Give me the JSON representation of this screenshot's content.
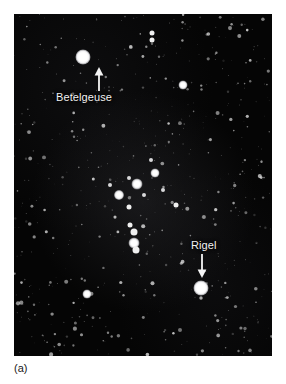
{
  "figure": {
    "caption": "(a)",
    "background_color": "#ffffff",
    "plate_color": "#050505"
  },
  "photo": {
    "subject": "Orion constellation night sky photograph",
    "frame": {
      "left": 14,
      "top": 14,
      "width": 258,
      "height": 342
    }
  },
  "annotations": [
    {
      "id": "betelgeuse",
      "label": "Betelgeuse",
      "label_x": 56,
      "label_y": 91,
      "arrow_direction": "up",
      "arrow_x": 84,
      "arrow_y_tail": 89,
      "arrow_y_head": 68,
      "target_star_x": 83,
      "target_star_y": 57
    },
    {
      "id": "rigel",
      "label": "Rigel",
      "label_x": 191,
      "label_y": 239,
      "arrow_direction": "down",
      "arrow_x": 201,
      "arrow_y_tail": 255,
      "arrow_y_head": 276,
      "target_star_x": 201,
      "target_star_y": 288
    }
  ],
  "chart_data": {
    "type": "scatter",
    "xlabel": "",
    "ylabel": "",
    "xlim": [
      14,
      272
    ],
    "ylim": [
      14,
      356
    ],
    "grid": false,
    "legend": null,
    "annotations": [
      "Betelgeuse",
      "Rigel",
      "(a)"
    ],
    "named_stars": [
      {
        "name": "Betelgeuse",
        "x": 83,
        "y": 57,
        "size": 15,
        "brightness": 1.0
      },
      {
        "name": "Rigel",
        "x": 201,
        "y": 288,
        "size": 15,
        "brightness": 1.0
      },
      {
        "name": "Bellatrix",
        "x": 183,
        "y": 85,
        "size": 9,
        "brightness": 0.8
      },
      {
        "name": "Saiph",
        "x": 87,
        "y": 294,
        "size": 9,
        "brightness": 0.78
      },
      {
        "name": "Alnitak",
        "x": 155,
        "y": 173,
        "size": 9,
        "brightness": 0.82
      },
      {
        "name": "Alnilam",
        "x": 137,
        "y": 184,
        "size": 11,
        "brightness": 0.9
      },
      {
        "name": "Mintaka",
        "x": 119,
        "y": 195,
        "size": 10,
        "brightness": 0.85
      },
      {
        "name": "Orion Nebula",
        "x": 134,
        "y": 243,
        "size": 11,
        "brightness": 0.88
      }
    ],
    "bright_stars": [
      [
        83,
        57,
        15
      ],
      [
        201,
        288,
        15
      ],
      [
        137,
        184,
        11
      ],
      [
        134,
        243,
        11
      ],
      [
        119,
        195,
        10
      ],
      [
        155,
        173,
        9
      ],
      [
        183,
        85,
        9
      ],
      [
        87,
        294,
        9
      ],
      [
        134,
        232,
        7
      ],
      [
        136,
        250,
        7
      ],
      [
        130,
        225,
        5
      ],
      [
        152,
        33,
        5
      ],
      [
        152,
        40,
        5
      ],
      [
        129,
        207,
        5
      ],
      [
        144,
        195,
        4
      ],
      [
        176,
        205,
        5
      ],
      [
        129,
        178,
        4
      ],
      [
        151,
        160,
        4
      ],
      [
        110,
        185,
        4
      ],
      [
        163,
        190,
        4
      ]
    ],
    "faint_star_count": 520
  }
}
